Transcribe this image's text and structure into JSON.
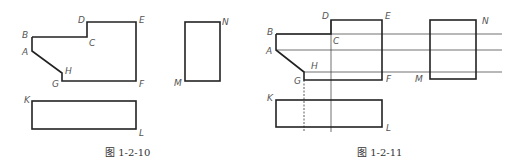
{
  "figures": [
    {
      "caption": "图  1-2-10",
      "labels": {
        "A": "A",
        "B": "B",
        "C": "C",
        "D": "D",
        "E": "E",
        "F": "F",
        "G": "G",
        "H": "H",
        "K": "K",
        "L": "L",
        "M": "M",
        "N": "N"
      }
    },
    {
      "caption": "图  1-2-11",
      "labels": {
        "A": "A",
        "B": "B",
        "C": "C",
        "D": "D",
        "E": "E",
        "F": "F",
        "G": "G",
        "H": "H",
        "K": "K",
        "L": "L",
        "M": "M",
        "N": "N"
      }
    }
  ],
  "colors": {
    "line": "#222222",
    "label": "#555555",
    "background": "#ffffff"
  }
}
